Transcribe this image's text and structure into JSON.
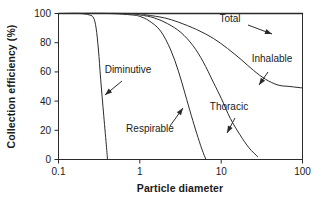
{
  "chart_data": {
    "type": "line",
    "title": "",
    "xlabel": "Particle diameter",
    "ylabel": "Collection efficiency (%)",
    "xscale": "log",
    "yscale": "linear",
    "xlim": [
      0.1,
      100
    ],
    "ylim": [
      0,
      100
    ],
    "xticks": [
      "0.1",
      "1",
      "10",
      "100"
    ],
    "xtick_values": [
      0.1,
      1,
      10,
      100
    ],
    "yticks": [
      "0",
      "20",
      "40",
      "60",
      "80",
      "100"
    ],
    "ytick_values": [
      0,
      20,
      40,
      60,
      80,
      100
    ],
    "grid": false,
    "legend": "inline-annotations",
    "line_color": "#2b2b2b",
    "background_color": "#ffffff",
    "series": [
      {
        "name": "Total",
        "label": "Total",
        "x": [
          0.1,
          0.3,
          1,
          3,
          10,
          30,
          100
        ],
        "values": [
          100,
          100,
          100,
          100,
          100,
          100,
          100
        ]
      },
      {
        "name": "Diminutive",
        "label": "Diminutive",
        "x": [
          0.1,
          0.18,
          0.24,
          0.27,
          0.29,
          0.31,
          0.33,
          0.36,
          0.39,
          0.4
        ],
        "values": [
          100,
          100,
          99,
          97,
          90,
          75,
          55,
          30,
          8,
          0
        ]
      },
      {
        "name": "Respirable",
        "label": "Respirable",
        "x": [
          0.1,
          0.4,
          0.8,
          1.0,
          1.3,
          1.8,
          2.4,
          3.0,
          3.6,
          4.3,
          5.0,
          5.8,
          6.5
        ],
        "values": [
          100,
          100,
          99,
          98,
          95,
          88,
          75,
          60,
          45,
          30,
          18,
          7,
          0
        ]
      },
      {
        "name": "Thoracic",
        "label": "Thoracic",
        "x": [
          0.1,
          0.6,
          1.0,
          1.5,
          2.2,
          3.2,
          4.5,
          6.0,
          8.0,
          10,
          13,
          17,
          22,
          28
        ],
        "values": [
          100,
          100,
          99,
          97,
          93,
          87,
          78,
          67,
          53,
          42,
          28,
          17,
          8,
          2
        ]
      },
      {
        "name": "Inhalable",
        "label": "Inhalable",
        "x": [
          0.1,
          0.8,
          1.2,
          2,
          3,
          5,
          8,
          12,
          18,
          25,
          35,
          50,
          70,
          100
        ],
        "values": [
          100,
          100,
          99,
          97,
          94,
          89,
          83,
          76,
          68,
          61,
          55,
          51,
          50,
          49
        ]
      }
    ],
    "annotations": [
      {
        "label": "Total",
        "text_x": 230,
        "text_y": 22,
        "anchor": "middle",
        "leader_from": [
          248,
          25
        ],
        "leader_to": [
          272,
          34
        ],
        "arrow_at": "end"
      },
      {
        "label": "Inhalable",
        "text_x": 272,
        "text_y": 62,
        "anchor": "middle",
        "leader_from": [
          268,
          72
        ],
        "leader_to": [
          259,
          85
        ],
        "arrow_at": "end"
      },
      {
        "label": "Thoracic",
        "text_x": 229,
        "text_y": 110,
        "anchor": "middle",
        "leader_from": [
          235,
          118
        ],
        "leader_to": [
          227,
          133
        ],
        "arrow_at": "end"
      },
      {
        "label": "Respirable",
        "text_x": 150,
        "text_y": 132,
        "anchor": "middle",
        "leader_from": [
          170,
          126
        ],
        "leader_to": [
          183,
          108
        ],
        "arrow_at": "end"
      },
      {
        "label": "Diminutive",
        "text_x": 128,
        "text_y": 73,
        "anchor": "middle",
        "leader_from": [
          122,
          81
        ],
        "leader_to": [
          105,
          95
        ],
        "arrow_at": "end"
      }
    ]
  }
}
